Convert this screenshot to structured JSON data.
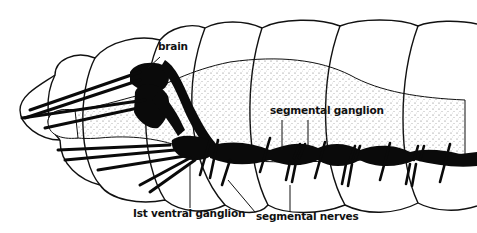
{
  "diagram": {
    "labels": {
      "brain": "brain",
      "segmental_ganglion": "segmental ganglion",
      "first_ventral_ganglion": "Ist ventral ganglion",
      "segmental_nerves": "segmental nerves"
    },
    "colors": {
      "outline": "#111111",
      "nerve_fill": "#0a0a0a",
      "stipple": "#555555",
      "background": "#ffffff"
    }
  }
}
